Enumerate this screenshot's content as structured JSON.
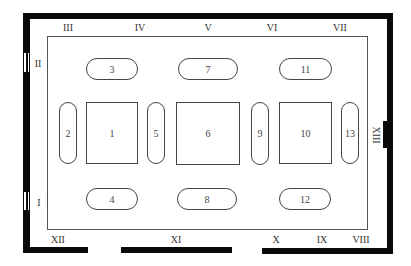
{
  "wall_labels": {
    "left": [
      "I",
      "II"
    ],
    "top": [
      "III",
      "IV",
      "V",
      "VI",
      "VII"
    ],
    "right": [
      "XIII"
    ],
    "bottom": [
      "VIII",
      "IX",
      "X",
      "XI",
      "XII"
    ]
  },
  "items": {
    "square": [
      "1",
      "6",
      "10"
    ],
    "vertical_pill": [
      "2",
      "5",
      "9",
      "13"
    ],
    "horizontal_pill_top": [
      "3",
      "7",
      "11"
    ],
    "horizontal_pill_bottom": [
      "4",
      "8",
      "12"
    ]
  },
  "colors": {
    "wall": "#0a0a0a",
    "line": "#555555",
    "text": "#333333",
    "background": "#ffffff"
  }
}
